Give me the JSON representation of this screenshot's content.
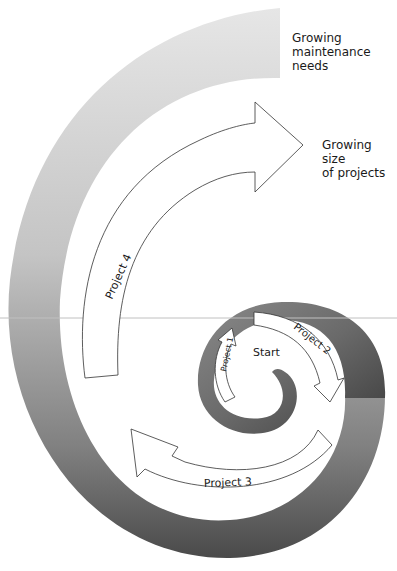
{
  "diagram": {
    "labels": {
      "maintenance": [
        "Growing",
        "maintenance",
        "needs"
      ],
      "size": [
        "Growing size",
        "of projects"
      ],
      "start": "Start"
    },
    "projects": [
      {
        "label": "Project 1"
      },
      {
        "label": "Project 2"
      },
      {
        "label": "Project 3"
      },
      {
        "label": "Project 4"
      }
    ],
    "colors": {
      "spiral_light": "#e2e2e2",
      "spiral_mid": "#a8a8a8",
      "spiral_dark": "#555555",
      "arrow_stroke": "#333333",
      "guide_line": "#c0c0c0"
    }
  }
}
